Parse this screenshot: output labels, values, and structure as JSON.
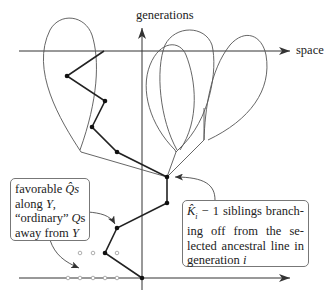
{
  "axes": {
    "vertical_label": "generations",
    "horizontal_label": "space"
  },
  "callouts": {
    "left": {
      "lines": [
        "favorable Q̂s",
        "along Y,",
        "“ordinary” Qs",
        "away from Y"
      ],
      "line1_text": "favorable ",
      "line1_sym": "Q̂",
      "line1_suffix": "s",
      "line2_text": "along ",
      "line2_sym": "Y",
      "line2_suffix": ",",
      "line3_text": "“ordinary” ",
      "line3_sym": "Q",
      "line3_suffix": "s",
      "line4_text": "away from ",
      "line4_sym": "Y"
    },
    "right": {
      "line1_sym": "K̂",
      "line1_sub": "i",
      "line1_text": " − 1 siblings branch-",
      "line2_text": "ing off from the se-",
      "line3_text": "lected ancestral line in",
      "line4_text": "generation ",
      "line4_sym": "i"
    }
  },
  "colors": {
    "line": "#333333",
    "thin_line": "#555555",
    "dot": "#111111",
    "hollow_dot": "#888888",
    "box_border": "#777777"
  }
}
